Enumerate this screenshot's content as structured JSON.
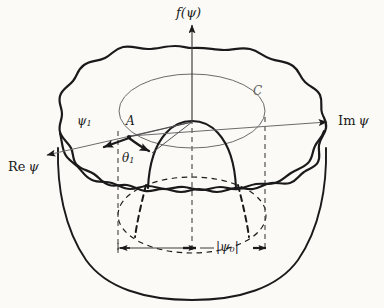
{
  "figure": {
    "name": "mexican-hat-potential",
    "caption_present": false,
    "background_color": "#fbfaf7",
    "ink_color": "#1a1a1a",
    "faint_ink_color": "#5d5d5d"
  },
  "labels": {
    "vertical_axis": "f(ψ)",
    "vertical_axis_parts": {
      "f": "f",
      "open": "(",
      "psi": "ψ",
      "close": ")"
    },
    "right_axis": "Im ψ",
    "right_axis_parts": {
      "prefix": "Im",
      "psi": "ψ"
    },
    "left_axis": "Re ψ",
    "left_axis_parts": {
      "prefix": "Re",
      "psi": "ψ"
    },
    "vector_psi1": "ψ",
    "vector_psi1_sub": "1",
    "point_A": "A",
    "angle_theta1": "θ",
    "angle_theta1_sub": "1",
    "contour_C": "C",
    "radius_psi0_open": "|",
    "radius_psi0_psi": "ψ",
    "radius_psi0_sub": "0",
    "radius_psi0_close": "|"
  },
  "geometry": {
    "origin": {
      "x": 192,
      "y": 122
    },
    "axis_vertical_top": {
      "x": 192,
      "y": 22
    },
    "axis_right_end": {
      "x": 330,
      "y": 122
    },
    "axis_left_end": {
      "x": 44,
      "y": 156
    },
    "point_A": {
      "x": 128,
      "y": 137
    },
    "psi1_arrow_tip": {
      "x": 99,
      "y": 148
    },
    "theta1_arrow_tip": {
      "x": 153,
      "y": 153
    },
    "contour_C_ellipse": {
      "cx": 192,
      "cy": 111,
      "rx": 73,
      "ry": 37
    },
    "trough_ellipse": {
      "cx": 192,
      "cy": 215,
      "rx": 74,
      "ry": 38
    },
    "measure_line_y": 248,
    "measure_left_x": 118,
    "measure_right_x": 265,
    "measure_center_x": 192
  },
  "elements": {
    "outer_rim": "wavy-closed-curve",
    "inner_trough_front": "wavy-curve",
    "central_hump": "parabolic-dome",
    "bowl_outline": "solid",
    "hidden_edges": "dashed",
    "dashed_vertical_left_x": 118,
    "dashed_vertical_center_x": 192,
    "dashed_vertical_right_x": 265
  }
}
